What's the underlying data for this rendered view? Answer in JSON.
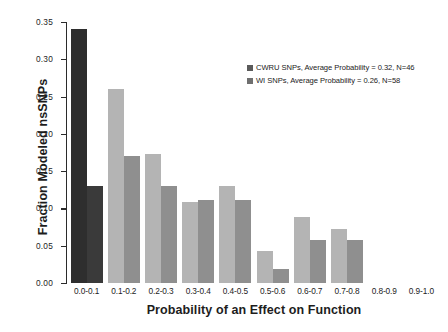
{
  "chart_data": {
    "type": "bar",
    "title": "",
    "xlabel": "Probability of an Effect on Function",
    "ylabel": "Fraction Modeled nsSNPs",
    "categories": [
      "0.0-0.1",
      "0.1-0.2",
      "0.2-0.3",
      "0.3-0.4",
      "0.4-0.5",
      "0.5-0.6",
      "0.6-0.7",
      "0.7-0.8",
      "0.8-0.9",
      "0.9-1.0"
    ],
    "series": [
      {
        "name": "CWRU SNPs, Average Probability = 0.32, N=46",
        "short_name": "CWRU SNPs",
        "color": "#b4b4b4",
        "values": [
          0.34,
          0.26,
          0.173,
          0.108,
          0.13,
          0.043,
          0.088,
          0.073,
          0.0,
          0.0
        ]
      },
      {
        "name": "WI SNPs, Average Probability = 0.26, N=58",
        "short_name": "WI SNPs",
        "color": "#8f8f8f",
        "values": [
          0.13,
          0.17,
          0.13,
          0.111,
          0.111,
          0.019,
          0.058,
          0.058,
          0.0,
          0.0
        ]
      }
    ],
    "ylim": [
      0.0,
      0.35
    ],
    "yticks": [
      "0.00",
      "0.05",
      "0.10",
      "0.15",
      "0.20",
      "0.25",
      "0.30",
      "0.35"
    ],
    "ytick_values": [
      0.0,
      0.05,
      0.1,
      0.15,
      0.2,
      0.25,
      0.3,
      0.35
    ],
    "grid": false,
    "legend_position": "upper right"
  },
  "legend": {
    "entries": [
      {
        "label": "CWRU SNPs, Average Probability = 0.32, N=46",
        "color": "#5a5a5a"
      },
      {
        "label": "WI SNPs, Average Probability = 0.26, N=58",
        "color": "#6f6f6f"
      }
    ]
  }
}
